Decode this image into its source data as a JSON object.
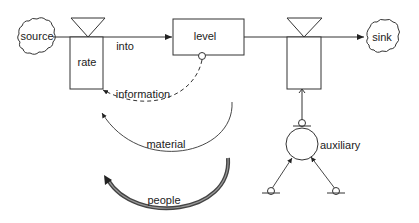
{
  "diagram": {
    "type": "stock-and-flow",
    "nodes": {
      "source": {
        "label": "source",
        "shape": "cloud"
      },
      "sink": {
        "label": "sink",
        "shape": "cloud"
      },
      "level": {
        "label": "level",
        "shape": "rectangle"
      },
      "rate": {
        "label": "rate",
        "shape": "valve-rectangle"
      },
      "outflow_rate": {
        "label": "",
        "shape": "valve-rectangle"
      },
      "auxiliary": {
        "label": "auxiliary",
        "shape": "circle"
      }
    },
    "edges": {
      "into": {
        "label": "into",
        "style": "solid-arrow"
      },
      "information": {
        "label": "information",
        "style": "dashed-arrow"
      },
      "material": {
        "label": "material",
        "style": "thin-solid-arc-arrow"
      },
      "people": {
        "label": "people",
        "style": "thick-double-arc-arrow"
      }
    },
    "colors": {
      "stroke": "#333333",
      "people_outer": "#444444",
      "people_inner": "#888888",
      "text": "#222222",
      "background": "#ffffff"
    }
  }
}
